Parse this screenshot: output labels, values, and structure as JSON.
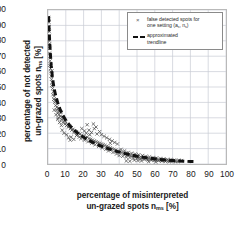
{
  "chart_data": {
    "type": "scatter",
    "title": "",
    "xlabel_line1": "percentage of misinterpreted",
    "xlabel_line2_pre": "un-grazed spots n",
    "xlabel_line2_sub": "ms",
    "xlabel_line2_post": " [%]",
    "ylabel_line1": "percentage of not detected",
    "ylabel_line2_pre": "un-grazed spots n",
    "ylabel_line2_sub": "ns",
    "ylabel_line2_post": " [%]",
    "xlim": [
      0,
      100
    ],
    "ylim": [
      0,
      100
    ],
    "xticks": [
      0,
      10,
      20,
      30,
      40,
      50,
      60,
      70,
      80,
      90,
      100
    ],
    "yticks": [
      0,
      10,
      20,
      30,
      40,
      50,
      60,
      70,
      80,
      90,
      100
    ],
    "grid": true,
    "legend_position": "top-right",
    "legend": [
      {
        "marker": "x-marker",
        "label_line1": "false detected spots for",
        "label_line2_pre": "one setting (a",
        "label_line2_sub1": "s",
        "label_line2_mid": ", n",
        "label_line2_sub2": "s",
        "label_line2_post": ")"
      },
      {
        "marker": "dashed-line",
        "label_line1": "approximated",
        "label_line2": "trendline"
      }
    ],
    "series": [
      {
        "name": "false detected spots for one setting",
        "marker": "x",
        "color": "#4a4a4a",
        "points": [
          [
            0.4,
            95.0
          ],
          [
            0.5,
            94.0
          ],
          [
            0.6,
            92.0
          ],
          [
            0.5,
            89.0
          ],
          [
            0.7,
            86.0
          ],
          [
            0.8,
            83.0
          ],
          [
            0.6,
            80.0
          ],
          [
            0.9,
            78.0
          ],
          [
            1.0,
            75.0
          ],
          [
            0.8,
            72.0
          ],
          [
            1.1,
            70.0
          ],
          [
            1.2,
            67.0
          ],
          [
            1.0,
            64.0
          ],
          [
            1.4,
            62.0
          ],
          [
            1.6,
            60.0
          ],
          [
            2.2,
            60.5
          ],
          [
            1.8,
            57.0
          ],
          [
            2.0,
            55.0
          ],
          [
            2.4,
            53.0
          ],
          [
            2.1,
            51.0
          ],
          [
            2.6,
            49.0
          ],
          [
            3.0,
            47.0
          ],
          [
            2.8,
            45.0
          ],
          [
            3.4,
            44.0
          ],
          [
            3.2,
            42.0
          ],
          [
            4.0,
            41.5
          ],
          [
            4.6,
            41.0
          ],
          [
            3.8,
            40.0
          ],
          [
            4.3,
            38.0
          ],
          [
            5.0,
            37.0
          ],
          [
            5.6,
            36.0
          ],
          [
            4.8,
            35.0
          ],
          [
            6.0,
            34.5
          ],
          [
            6.6,
            34.0
          ],
          [
            5.4,
            33.0
          ],
          [
            7.2,
            33.5
          ],
          [
            6.2,
            32.0
          ],
          [
            7.0,
            31.0
          ],
          [
            8.0,
            30.5
          ],
          [
            5.8,
            30.0
          ],
          [
            8.6,
            29.5
          ],
          [
            7.6,
            29.0
          ],
          [
            9.2,
            28.0
          ],
          [
            8.4,
            27.0
          ],
          [
            10.0,
            27.5
          ],
          [
            9.6,
            26.0
          ],
          [
            11.0,
            25.5
          ],
          [
            10.4,
            25.0
          ],
          [
            12.0,
            24.5
          ],
          [
            11.4,
            24.0
          ],
          [
            13.0,
            23.5
          ],
          [
            12.6,
            23.0
          ],
          [
            14.0,
            22.5
          ],
          [
            13.4,
            22.0
          ],
          [
            15.0,
            21.5
          ],
          [
            16.0,
            21.0
          ],
          [
            14.6,
            20.5
          ],
          [
            17.0,
            20.0
          ],
          [
            18.0,
            19.5
          ],
          [
            16.4,
            19.0
          ],
          [
            19.0,
            18.5
          ],
          [
            20.0,
            18.0
          ],
          [
            17.6,
            17.5
          ],
          [
            21.0,
            17.0
          ],
          [
            22.0,
            17.5
          ],
          [
            13.0,
            17.5
          ],
          [
            14.5,
            16.0
          ],
          [
            16.0,
            18.5
          ],
          [
            18.5,
            16.5
          ],
          [
            20.5,
            15.5
          ],
          [
            23.0,
            16.5
          ],
          [
            24.0,
            16.0
          ],
          [
            25.0,
            15.5
          ],
          [
            22.5,
            14.5
          ],
          [
            26.0,
            15.0
          ],
          [
            27.0,
            14.5
          ],
          [
            24.5,
            13.5
          ],
          [
            28.0,
            14.0
          ],
          [
            29.0,
            13.5
          ],
          [
            26.5,
            12.5
          ],
          [
            30.0,
            13.0
          ],
          [
            31.0,
            12.5
          ],
          [
            28.5,
            11.5
          ],
          [
            32.0,
            12.0
          ],
          [
            33.0,
            11.5
          ],
          [
            30.5,
            10.5
          ],
          [
            34.0,
            11.0
          ],
          [
            35.0,
            10.5
          ],
          [
            32.5,
            9.5
          ],
          [
            36.0,
            10.0
          ],
          [
            23.0,
            22.0
          ],
          [
            24.5,
            20.5
          ],
          [
            26.0,
            23.0
          ],
          [
            27.5,
            19.5
          ],
          [
            29.0,
            21.0
          ],
          [
            25.5,
            26.0
          ],
          [
            27.0,
            24.0
          ],
          [
            30.0,
            19.0
          ],
          [
            31.5,
            18.0
          ],
          [
            33.0,
            17.0
          ],
          [
            34.5,
            16.0
          ],
          [
            36.0,
            15.0
          ],
          [
            37.5,
            14.0
          ],
          [
            39.0,
            13.0
          ],
          [
            35.0,
            13.5
          ],
          [
            37.0,
            9.5
          ],
          [
            38.0,
            9.0
          ],
          [
            34.0,
            8.5
          ],
          [
            39.5,
            8.5
          ],
          [
            40.5,
            8.0
          ],
          [
            36.5,
            7.5
          ],
          [
            41.5,
            7.5
          ],
          [
            42.5,
            7.0
          ],
          [
            38.5,
            6.5
          ],
          [
            43.5,
            6.5
          ],
          [
            44.5,
            6.0
          ],
          [
            40.0,
            5.5
          ],
          [
            45.5,
            5.8
          ],
          [
            46.5,
            5.5
          ],
          [
            42.0,
            5.0
          ],
          [
            47.5,
            5.2
          ],
          [
            48.5,
            5.0
          ],
          [
            44.0,
            4.5
          ],
          [
            49.5,
            4.8
          ],
          [
            50.5,
            4.5
          ],
          [
            46.0,
            4.2
          ],
          [
            51.5,
            4.3
          ],
          [
            52.5,
            4.0
          ],
          [
            48.0,
            3.8
          ],
          [
            53.5,
            3.9
          ],
          [
            54.5,
            3.6
          ],
          [
            50.0,
            3.5
          ],
          [
            55.5,
            3.5
          ],
          [
            56.5,
            3.3
          ],
          [
            52.0,
            3.2
          ],
          [
            57.5,
            3.2
          ],
          [
            58.5,
            3.0
          ],
          [
            54.0,
            2.9
          ],
          [
            59.5,
            2.9
          ],
          [
            60.5,
            2.8
          ],
          [
            56.0,
            2.7
          ],
          [
            61.5,
            2.7
          ],
          [
            62.5,
            2.6
          ],
          [
            58.0,
            2.5
          ],
          [
            63.5,
            2.5
          ],
          [
            64.5,
            2.4
          ],
          [
            60.0,
            2.3
          ],
          [
            65.5,
            2.3
          ],
          [
            66.5,
            2.2
          ],
          [
            62.0,
            2.1
          ],
          [
            67.5,
            2.1
          ],
          [
            68.5,
            2.0
          ],
          [
            64.0,
            1.9
          ],
          [
            69.5,
            2.0
          ],
          [
            70.5,
            1.9
          ],
          [
            66.0,
            1.8
          ],
          [
            71.5,
            1.8
          ],
          [
            72.0,
            1.7
          ],
          [
            68.0,
            1.6
          ],
          [
            73.0,
            1.7
          ],
          [
            41.0,
            9.5
          ],
          [
            43.0,
            8.5
          ],
          [
            45.0,
            7.5
          ],
          [
            47.0,
            7.0
          ],
          [
            49.0,
            6.5
          ],
          [
            51.0,
            6.0
          ],
          [
            53.0,
            5.5
          ],
          [
            55.0,
            5.0
          ],
          [
            57.0,
            4.6
          ],
          [
            59.0,
            4.2
          ],
          [
            61.0,
            3.9
          ],
          [
            63.0,
            3.6
          ],
          [
            65.0,
            3.3
          ],
          [
            67.0,
            3.0
          ],
          [
            69.0,
            2.8
          ],
          [
            71.0,
            2.6
          ],
          [
            73.5,
            2.4
          ],
          [
            75.0,
            2.2
          ],
          [
            44.0,
            2.0
          ],
          [
            46.0,
            1.8
          ],
          [
            48.5,
            2.5
          ],
          [
            50.5,
            2.2
          ],
          [
            52.5,
            2.0
          ],
          [
            56.5,
            1.5
          ],
          [
            60.5,
            1.3
          ],
          [
            8.0,
            22.0
          ],
          [
            9.0,
            20.0
          ],
          [
            10.5,
            19.0
          ],
          [
            11.5,
            17.0
          ],
          [
            12.5,
            15.5
          ],
          [
            7.5,
            25.0
          ],
          [
            6.5,
            27.0
          ],
          [
            5.5,
            29.0
          ],
          [
            4.5,
            32.0
          ],
          [
            3.5,
            35.0
          ],
          [
            19.0,
            23.0
          ],
          [
            20.5,
            21.5
          ],
          [
            21.5,
            20.0
          ],
          [
            22.0,
            25.5
          ],
          [
            23.5,
            19.0
          ]
        ]
      }
    ],
    "trendline": {
      "name": "approximated trendline",
      "style": "dashed",
      "color": "#111111",
      "xmax": 83,
      "points": [
        [
          0.3,
          96.0
        ],
        [
          0.6,
          88.0
        ],
        [
          0.9,
          80.0
        ],
        [
          1.3,
          72.0
        ],
        [
          1.8,
          64.0
        ],
        [
          2.4,
          57.0
        ],
        [
          3.2,
          50.5
        ],
        [
          4.2,
          45.0
        ],
        [
          5.4,
          40.0
        ],
        [
          6.8,
          35.5
        ],
        [
          8.4,
          31.5
        ],
        [
          10.2,
          28.0
        ],
        [
          12.2,
          25.0
        ],
        [
          14.4,
          22.3
        ],
        [
          16.8,
          20.0
        ],
        [
          19.4,
          17.8
        ],
        [
          22.2,
          15.8
        ],
        [
          25.2,
          14.0
        ],
        [
          28.4,
          12.3
        ],
        [
          31.8,
          10.8
        ],
        [
          35.4,
          9.3
        ],
        [
          39.2,
          8.0
        ],
        [
          43.2,
          6.8
        ],
        [
          47.4,
          5.7
        ],
        [
          51.8,
          4.7
        ],
        [
          56.4,
          3.9
        ],
        [
          61.2,
          3.2
        ],
        [
          66.2,
          2.6
        ],
        [
          71.4,
          2.1
        ],
        [
          76.8,
          1.8
        ],
        [
          80.0,
          1.6
        ],
        [
          83.0,
          1.5
        ]
      ]
    }
  }
}
